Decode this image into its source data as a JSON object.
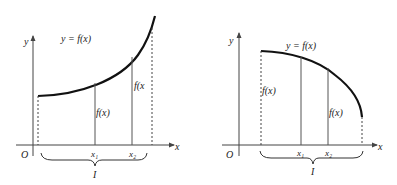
{
  "colors": {
    "curve": "#111111",
    "axis": "#444444",
    "line": "#555555",
    "text": "#222222",
    "background": "#ffffff"
  },
  "diagrams": [
    {
      "id": "increasing",
      "title": "y = f(x) increasing on interval I",
      "axis_labels": {
        "y": "y",
        "x": "x",
        "origin": "O"
      },
      "curve_label": "y = f(x)",
      "value_labels": [
        "f(x)",
        "f(x"
      ],
      "points": [
        "x₁",
        "x₂"
      ],
      "interval_label": "I"
    },
    {
      "id": "decreasing",
      "title": "y = f(x) decreasing on interval I",
      "axis_labels": {
        "y": "y",
        "x": "x",
        "origin": "O"
      },
      "curve_label": "y = f(x)",
      "value_labels": [
        "f(x)",
        "f(x)"
      ],
      "points": [
        "x₁",
        "x₂"
      ],
      "interval_label": "I"
    }
  ]
}
